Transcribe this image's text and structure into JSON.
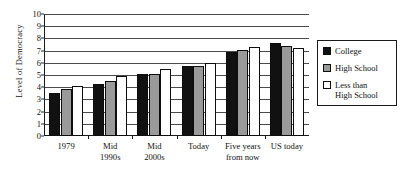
{
  "chart_data": {
    "type": "bar",
    "title": "",
    "xlabel": "",
    "ylabel": "Level of Democracy",
    "ylim": [
      0,
      10
    ],
    "yticks": [
      "0",
      "1",
      "2",
      "3",
      "4",
      "5",
      "6",
      "7",
      "8",
      "9",
      "10"
    ],
    "grid": true,
    "legend_position": "right",
    "categories": [
      "1979",
      "Mid 1990s",
      "Mid 2000s",
      "Today",
      "Five years from now",
      "US today"
    ],
    "category_lines": [
      {
        "line1": "1979",
        "line2": ""
      },
      {
        "line1": "Mid",
        "line2": "1990s"
      },
      {
        "line1": "Mid",
        "line2": "2000s"
      },
      {
        "line1": "Today",
        "line2": ""
      },
      {
        "line1": "Five years",
        "line2": "from now"
      },
      {
        "line1": "US today",
        "line2": ""
      }
    ],
    "series": [
      {
        "name": "College",
        "color": "#111111",
        "values": [
          3.5,
          4.25,
          5.1,
          5.7,
          6.9,
          7.6
        ]
      },
      {
        "name": "High School",
        "color": "#9a9a9a",
        "values": [
          3.85,
          4.5,
          5.1,
          5.7,
          7.05,
          7.4
        ]
      },
      {
        "name": "Less than High School",
        "color": "#ffffff",
        "values": [
          4.1,
          4.9,
          5.5,
          6.0,
          7.3,
          7.2
        ]
      }
    ]
  },
  "legend": {
    "items": [
      {
        "label": "College",
        "swatch": "black-square-swatch"
      },
      {
        "label": "High School",
        "swatch": "gray-square-swatch"
      },
      {
        "label": "Less than\nHigh School",
        "swatch": "white-square-swatch"
      }
    ]
  }
}
